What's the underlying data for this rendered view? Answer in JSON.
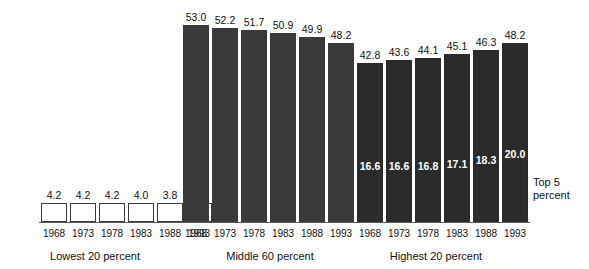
{
  "chart_data": {
    "type": "bar",
    "title": "",
    "subtitle": "",
    "xlabel": "",
    "ylabel": "",
    "ylim": [
      0,
      55
    ],
    "grid": false,
    "legend": "none",
    "categories": [
      "1968",
      "1973",
      "1978",
      "1983",
      "1988",
      "1993"
    ],
    "groups": [
      {
        "name": "lowest",
        "label": "Lowest 20 percent",
        "style": "outline",
        "values": [
          4.2,
          4.2,
          4.2,
          4.0,
          3.8,
          3.6
        ],
        "value_labels": [
          "4.2",
          "4.2",
          "4.2",
          "4.0",
          "3.8",
          "3.6"
        ],
        "tick_labels": [
          "1968",
          "1973",
          "1978",
          "1983",
          "1988",
          "1993"
        ]
      },
      {
        "name": "middle",
        "label": "Middle 60 percent",
        "style": "solid-mid",
        "values": [
          53.0,
          52.2,
          51.7,
          50.9,
          49.9,
          48.2
        ],
        "value_labels": [
          "53.0",
          "52.2",
          "51.7",
          "50.9",
          "49.9",
          "48.2"
        ],
        "tick_labels": [
          "1968",
          "1973",
          "1978",
          "1983",
          "1988",
          "1993"
        ]
      },
      {
        "name": "highest",
        "label": "Highest 20 percent",
        "style": "solid-dark",
        "values": [
          42.8,
          43.6,
          44.1,
          45.1,
          46.3,
          48.2
        ],
        "value_labels": [
          "42.8",
          "43.6",
          "44.1",
          "45.1",
          "46.3",
          "48.2"
        ],
        "tick_labels": [
          "1968",
          "1973",
          "1978",
          "1983",
          "1988",
          "1993"
        ],
        "inner_series_name": "Top 5 percent",
        "inner_values": [
          16.6,
          16.6,
          16.8,
          17.1,
          18.3,
          20.0
        ],
        "inner_value_labels": [
          "16.6",
          "16.6",
          "16.8",
          "17.1",
          "18.3",
          "20.0"
        ]
      }
    ],
    "annotations": [
      {
        "name": "top-5-percent-bracket",
        "text_line1": "Top 5",
        "text_line2": "percent"
      }
    ],
    "colors": {
      "bar_mid": "#3a3a3a",
      "bar_dark": "#2b2b2b",
      "bar_outline": "#3b3b3b",
      "background": "#ffffff",
      "text": "#111111",
      "inner_label": "#ffffff"
    }
  }
}
